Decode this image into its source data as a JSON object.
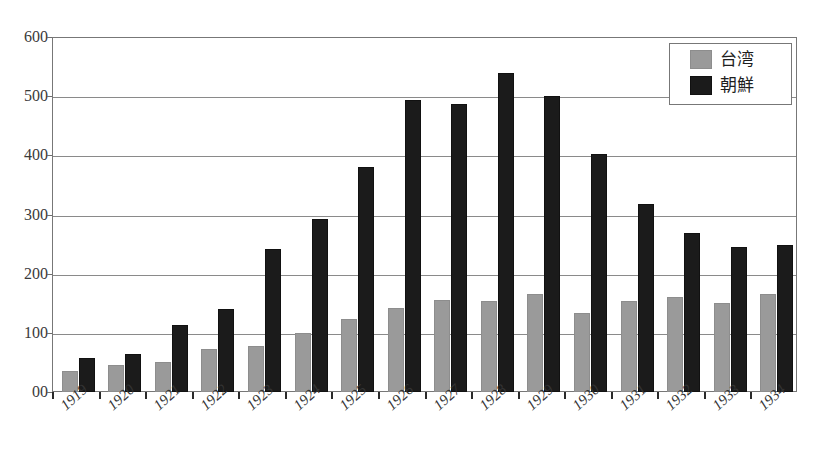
{
  "title_remnant": "",
  "legend": {
    "position": "top-right",
    "entries": [
      {
        "label": "台湾",
        "color": "#9a9a9a",
        "name": "taiwan"
      },
      {
        "label": "朝鮮",
        "color": "#1b1b1b",
        "name": "korea"
      }
    ]
  },
  "axis": {
    "y_ticks": [
      "600",
      "500",
      "400",
      "300",
      "200",
      "100",
      "00"
    ],
    "y_tick_values": [
      600,
      500,
      400,
      300,
      200,
      100,
      0
    ]
  },
  "chart_data": {
    "type": "bar",
    "title": "",
    "subtitle": "",
    "xlabel": "",
    "ylabel": "",
    "ylim": [
      0,
      600
    ],
    "ytick_labels": [
      "00",
      "100",
      "200",
      "300",
      "400",
      "500",
      "600"
    ],
    "grid": true,
    "legend_position": "top-right",
    "categories": [
      "1919",
      "1920",
      "1921",
      "1922",
      "1923",
      "1924",
      "1925",
      "1926",
      "1927",
      "1928",
      "1929",
      "1930",
      "1931",
      "1932",
      "1933",
      "1934"
    ],
    "series": [
      {
        "name": "台湾",
        "color": "#9a9a9a",
        "values": [
          35,
          45,
          51,
          72,
          78,
          100,
          123,
          142,
          155,
          153,
          166,
          134,
          154,
          160,
          151,
          166
        ]
      },
      {
        "name": "朝鮮",
        "color": "#1b1b1b",
        "values": [
          57,
          64,
          113,
          140,
          241,
          292,
          380,
          493,
          487,
          540,
          500,
          403,
          318,
          269,
          245,
          249
        ]
      }
    ]
  }
}
